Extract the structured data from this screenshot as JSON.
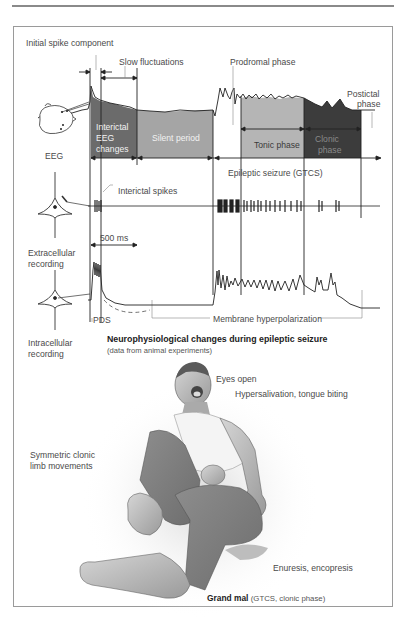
{
  "figure": {
    "title": "Neurophysiological changes during epileptic seizure",
    "subtitle": "(data from animal experiments)",
    "caption_bold": "Grand mal",
    "caption_rest": "(GTCS, clonic phase)"
  },
  "eeg_panel": {
    "labels": {
      "initial_spike": "Initial spike component",
      "slow_fluctuations": "Slow fluctuations",
      "prodromal": "Prodromal phase",
      "postictal_line1": "Postictal",
      "postictal_line2": "phase",
      "interictal_eeg_line1": "Interictal",
      "interictal_eeg_line2": "EEG",
      "interictal_eeg_line3": "changes",
      "silent_period": "Silent period",
      "tonic_phase": "Tonic phase",
      "clonic_line1": "Clonic",
      "clonic_line2": "phase",
      "eeg": "EEG",
      "epileptic_seizure": "Epileptic seizure (GTCS)"
    },
    "colors": {
      "interictal": "#6b6b6b",
      "silent": "#a5a5a5",
      "tonic": "#b5b5b5",
      "clonic": "#3c3c3c"
    }
  },
  "extracellular_panel": {
    "interictal_spikes": "Interictal spikes",
    "recording_line1": "Extracellular",
    "recording_line2": "recording",
    "time_scale": "500 ms"
  },
  "intracellular_panel": {
    "pds": "PDS",
    "membrane_hyperpolarization": "Membrane hyperpolarization",
    "recording_line1": "Intracellular",
    "recording_line2": "recording"
  },
  "illustration": {
    "eyes_open": "Eyes open",
    "hypersalivation": "Hypersalivation, tongue biting",
    "limb_line1": "Symmetric clonic",
    "limb_line2": "limb movements",
    "enuresis": "Enuresis, encopresis"
  }
}
